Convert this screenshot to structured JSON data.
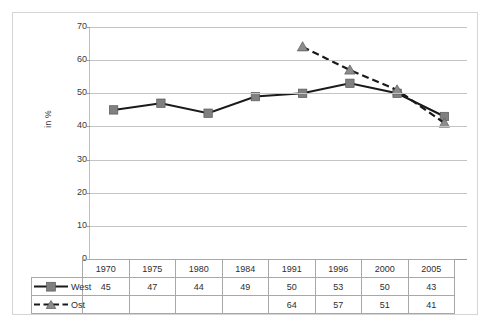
{
  "chart_data": {
    "type": "line",
    "title": "",
    "xlabel": "",
    "ylabel": "in %",
    "ylim": [
      0,
      70
    ],
    "ytick_step": 10,
    "yticks": [
      70,
      60,
      50,
      40,
      30,
      20,
      10,
      0
    ],
    "grid": true,
    "legend_position": "data-table-row-labels",
    "categories": [
      "1970",
      "1975",
      "1980",
      "1984",
      "1991",
      "1996",
      "2000",
      "2005"
    ],
    "series": [
      {
        "name": "West",
        "marker": "square",
        "linestyle": "solid",
        "color": "#808080",
        "line_color": "#1a1a1a",
        "values": [
          45,
          47,
          44,
          49,
          50,
          53,
          50,
          43
        ],
        "value_labels": [
          "45",
          "47",
          "44",
          "49",
          "50",
          "53",
          "50",
          "43"
        ]
      },
      {
        "name": "Ost",
        "marker": "triangle",
        "linestyle": "dashed",
        "color": "#8c8c8c",
        "line_color": "#1a1a1a",
        "values": [
          null,
          null,
          null,
          null,
          64,
          57,
          51,
          41
        ],
        "value_labels": [
          "",
          "",
          "",
          "",
          "64",
          "57",
          "51",
          "41"
        ]
      }
    ]
  },
  "axis": {
    "y_title": "in %",
    "tick_labels": [
      "70",
      "60",
      "50",
      "40",
      "30",
      "20",
      "10",
      "0"
    ]
  },
  "table": {
    "year_header": [
      "1970",
      "1975",
      "1980",
      "1984",
      "1991",
      "1996",
      "2000",
      "2005"
    ],
    "rows": [
      {
        "label": "West",
        "marker_icon": "solid-line-square-marker-icon",
        "values": [
          "45",
          "47",
          "44",
          "49",
          "50",
          "53",
          "50",
          "43"
        ]
      },
      {
        "label": "Ost",
        "marker_icon": "dashed-line-triangle-marker-icon",
        "values": [
          "",
          "",
          "",
          "",
          "64",
          "57",
          "51",
          "41"
        ]
      }
    ]
  },
  "colors": {
    "marker_gray": "#808080",
    "line_black": "#1a1a1a",
    "gridline": "#c4c4c4",
    "border": "#a8a8a8",
    "outer_border": "#d5d5d5",
    "text": "#2e2e2e"
  }
}
